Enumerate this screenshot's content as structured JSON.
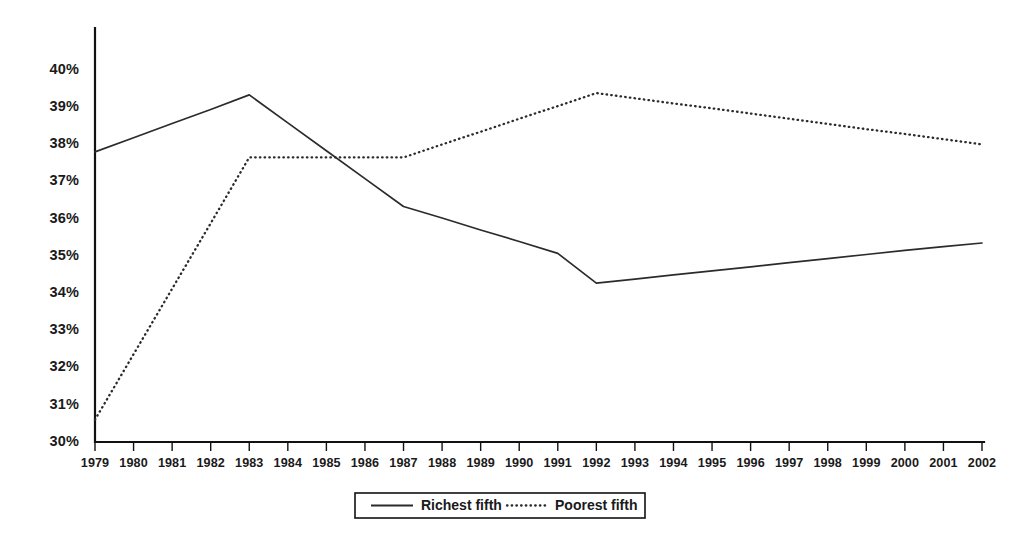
{
  "chart_data": {
    "type": "line",
    "title": "",
    "subtitle": "",
    "xlabel": "",
    "ylabel": "",
    "grid": false,
    "legend_position": "bottom-center",
    "x": [
      1979,
      1980,
      1981,
      1982,
      1983,
      1984,
      1985,
      1986,
      1987,
      1988,
      1989,
      1990,
      1991,
      1992,
      1993,
      1994,
      1995,
      1996,
      1997,
      1998,
      1999,
      2000,
      2001,
      2002
    ],
    "xlim": [
      1979,
      2002
    ],
    "ylim": [
      30,
      40.8
    ],
    "ytick_values": [
      30,
      31,
      32,
      33,
      34,
      35,
      36,
      37,
      38,
      39,
      40
    ],
    "ytick_labels": [
      "30%",
      "31%",
      "32%",
      "33%",
      "34%",
      "35%",
      "36%",
      "37%",
      "38%",
      "39%",
      "40%"
    ],
    "xtick_labels": [
      "1979",
      "1980",
      "1981",
      "1982",
      "1983",
      "1984",
      "1985",
      "1986",
      "1987",
      "1988",
      "1989",
      "1990",
      "1991",
      "1992",
      "1993",
      "1994",
      "1995",
      "1996",
      "1997",
      "1998",
      "1999",
      "2000",
      "2001",
      "2002"
    ],
    "series": [
      {
        "name": "Richest fifth",
        "style": "solid",
        "color": "#2b2b2b",
        "values": [
          37.8,
          38.18,
          38.56,
          38.94,
          39.33,
          38.58,
          37.83,
          37.08,
          36.33,
          36.02,
          35.7,
          35.39,
          35.07,
          34.27,
          34.38,
          34.49,
          34.6,
          34.71,
          34.82,
          34.93,
          35.04,
          35.15,
          35.25,
          35.35
        ]
      },
      {
        "name": "Poorest fifth",
        "style": "dotted",
        "color": "#2b2b2b",
        "values": [
          30.6,
          32.36,
          34.12,
          35.88,
          37.65,
          37.65,
          37.65,
          37.65,
          37.65,
          38.0,
          38.34,
          38.69,
          39.03,
          39.38,
          39.24,
          39.1,
          38.97,
          38.83,
          38.69,
          38.55,
          38.41,
          38.28,
          38.14,
          38.0
        ]
      }
    ]
  },
  "legend": {
    "entries": [
      {
        "label": "Richest fifth",
        "style": "solid"
      },
      {
        "label": "Poorest fifth",
        "style": "dotted"
      }
    ]
  }
}
